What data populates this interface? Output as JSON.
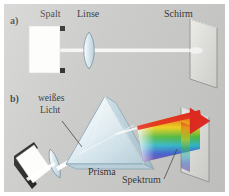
{
  "figure": {
    "background_color": "#c9c9c7",
    "frame_color": "#ffffff",
    "text_color": "#1b1b1b"
  },
  "panels": [
    {
      "id": "a",
      "label": "a)",
      "labels": {
        "slit": "Spalt",
        "lens": "Linse",
        "screen": "Schirm"
      }
    },
    {
      "id": "b",
      "label": "b)",
      "labels": {
        "white_light_line1": "weißes",
        "white_light_line2": "Licht",
        "prism": "Prisma",
        "spectrum": "Spektrum"
      }
    }
  ],
  "spectrum": {
    "order_top_to_bottom": [
      "rot",
      "orange",
      "gelb",
      "grün",
      "cyan",
      "blau",
      "violett"
    ],
    "colors": [
      "#e8140a",
      "#f47a00",
      "#f5d400",
      "#3fb92b",
      "#19b7c9",
      "#2a4fd0",
      "#6a2fa0"
    ]
  },
  "optics": {
    "beam_color": "#ffffff",
    "glass_color": "#dbe8ee",
    "glass_edge_color": "#7f9aa8",
    "screen_face_color": "#e3e3e0",
    "screen_edge_color": "#8d8d8a",
    "slit_body_color": "#1d1d1d",
    "slit_opening_color": "#fdfdfb"
  }
}
